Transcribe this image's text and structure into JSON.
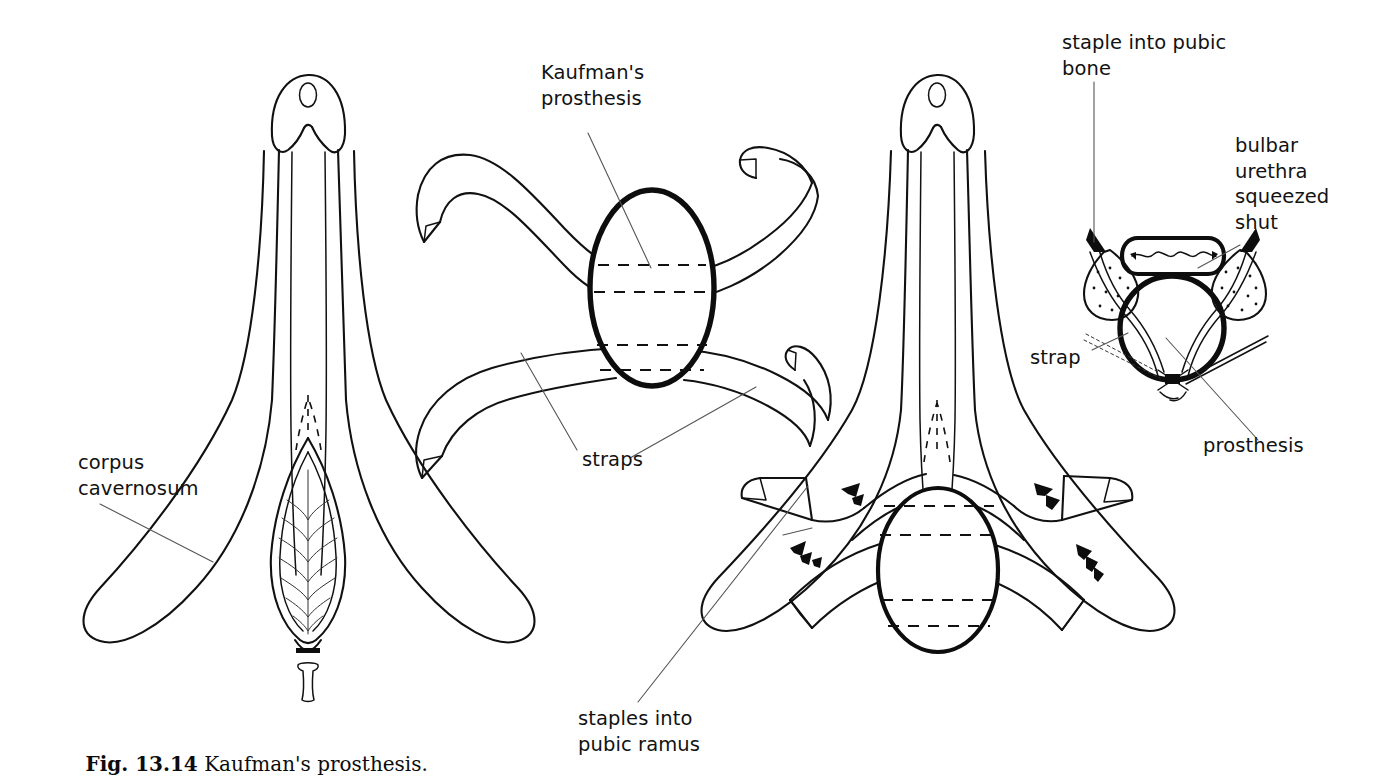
{
  "figure": {
    "caption_number": "Fig. 13.14",
    "caption_text": "Kaufman's prosthesis.",
    "ink_color": "#111111",
    "background_color": "#ffffff"
  },
  "labels": {
    "corpus_cavernosum": "corpus\ncavernosum",
    "kaufmans_prosthesis": "Kaufman's\nprosthesis",
    "straps": "straps",
    "staples_into_pubic_ramus": "staples into\npubic ramus",
    "staple_into_pubic_bone": "staple into pubic\nbone",
    "bulbar_urethra_squeezed_shut": "bulbar\nurethra\nsqueezed\nshut",
    "strap": "strap",
    "prosthesis": "prosthesis"
  },
  "panels": {
    "panel_1_name": "penis-anatomy-frontal-view",
    "panel_2_name": "prosthesis-device-with-straps",
    "panel_3_name": "prosthesis-implanted-with-staples",
    "panel_4_name": "cross-section-urethra-compressed"
  }
}
